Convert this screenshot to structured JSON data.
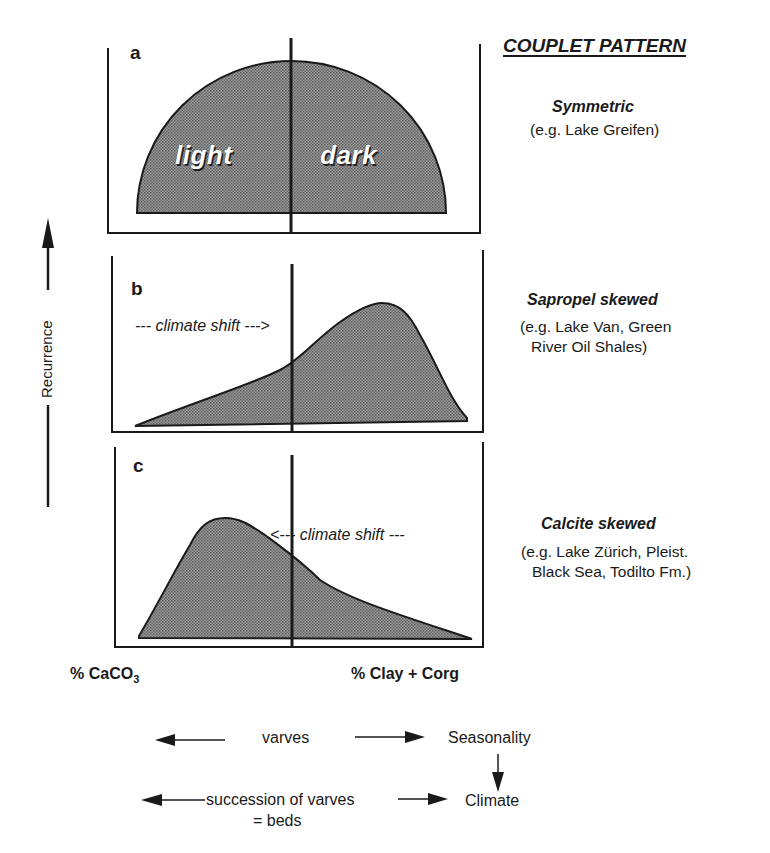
{
  "title": "COUPLET PATTERN",
  "y_axis_label": "Recurrence",
  "x_axis": {
    "left_label": "% CaCO",
    "left_subscript": "3",
    "right_label": "% Clay + Corg"
  },
  "panels": [
    {
      "letter": "a",
      "pattern_name": "Symmetric",
      "example_lines": [
        "(e.g. Lake Greifen)"
      ],
      "inner_labels": [
        "light",
        "dark"
      ]
    },
    {
      "letter": "b",
      "pattern_name": "Sapropel skewed",
      "example_lines": [
        "(e.g. Lake Van, Green",
        "River Oil Shales)"
      ],
      "shift_label": "--- climate shift --->"
    },
    {
      "letter": "c",
      "pattern_name": "Calcite skewed",
      "example_lines": [
        "(e.g. Lake Zürich, Pleist.",
        "Black Sea, Todilto Fm.)"
      ],
      "shift_label": "<--- climate shift ---"
    }
  ],
  "flow": {
    "varves": "varves",
    "seasonality": "Seasonality",
    "succession": "succession of varves",
    "beds": "= beds",
    "climate": "Climate"
  },
  "colors": {
    "fill": "#8a8a8a",
    "line": "#1a1a1a",
    "background": "#ffffff"
  }
}
